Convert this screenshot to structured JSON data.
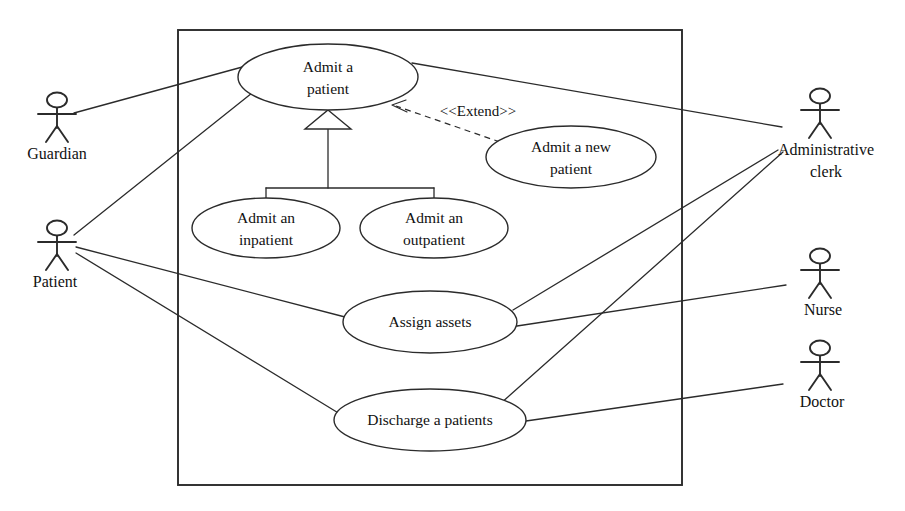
{
  "diagram": {
    "type": "uml-use-case-diagram",
    "system_boundary": {
      "x": 178,
      "y": 30,
      "width": 504,
      "height": 455
    },
    "use_cases": [
      {
        "id": "admit_a_patient",
        "lines": [
          "Admit a",
          "patient"
        ],
        "cx": 328,
        "cy": 77,
        "rx": 90,
        "ry": 33
      },
      {
        "id": "admit_a_new_patient",
        "lines": [
          "Admit a new",
          "patient"
        ],
        "cx": 571,
        "cy": 157,
        "rx": 85,
        "ry": 31
      },
      {
        "id": "admit_an_inpatient",
        "lines": [
          "Admit an",
          "inpatient"
        ],
        "cx": 266,
        "cy": 228,
        "rx": 74,
        "ry": 30
      },
      {
        "id": "admit_an_outpatient",
        "lines": [
          "Admit an",
          "outpatient"
        ],
        "cx": 434,
        "cy": 228,
        "rx": 74,
        "ry": 30
      },
      {
        "id": "assign_assets",
        "lines": [
          "Assign assets"
        ],
        "cx": 430,
        "cy": 322,
        "rx": 87,
        "ry": 31
      },
      {
        "id": "discharge_a_patients",
        "lines": [
          "Discharge a patients"
        ],
        "cx": 430,
        "cy": 420,
        "rx": 96,
        "ry": 31
      }
    ],
    "actors": [
      {
        "id": "guardian",
        "label_lines": [
          "Guardian"
        ],
        "x": 57,
        "y": 100,
        "label_x": 57,
        "label_y": 150
      },
      {
        "id": "patient",
        "label_lines": [
          "Patient"
        ],
        "x": 57,
        "y": 228,
        "label_x": 55,
        "label_y": 278
      },
      {
        "id": "administrative_clerk",
        "label_lines": [
          "Administrative",
          "clerk"
        ],
        "x": 820,
        "y": 96,
        "label_x": 826,
        "label_y": 150
      },
      {
        "id": "nurse",
        "label_lines": [
          "Nurse"
        ],
        "x": 820,
        "y": 256,
        "label_x": 823,
        "label_y": 306
      },
      {
        "id": "doctor",
        "label_lines": [
          "Doctor"
        ],
        "x": 820,
        "y": 348,
        "label_x": 822,
        "label_y": 398
      }
    ],
    "associations": [
      {
        "from": "guardian",
        "to": "admit_a_patient",
        "x1": 74,
        "y1": 113,
        "x2": 246,
        "y2": 66
      },
      {
        "from": "patient",
        "to": "admit_a_patient",
        "x1": 74,
        "y1": 235,
        "x2": 252,
        "y2": 93
      },
      {
        "from": "patient",
        "to": "assign_assets",
        "x1": 76,
        "y1": 247,
        "x2": 345,
        "y2": 317
      },
      {
        "from": "patient",
        "to": "discharge_a_patients",
        "x1": 76,
        "y1": 253,
        "x2": 340,
        "y2": 414
      },
      {
        "from": "administrative_clerk",
        "to": "admit_a_patient",
        "x1": 782,
        "y1": 127,
        "x2": 412,
        "y2": 63
      },
      {
        "from": "administrative_clerk",
        "to": "assign_assets",
        "x1": 778,
        "y1": 150,
        "x2": 513,
        "y2": 310
      },
      {
        "from": "administrative_clerk",
        "to": "discharge_a_patients",
        "x1": 783,
        "y1": 152,
        "x2": 500,
        "y2": 404
      },
      {
        "from": "nurse",
        "to": "assign_assets",
        "x1": 786,
        "y1": 285,
        "x2": 517,
        "y2": 326
      },
      {
        "from": "doctor",
        "to": "discharge_a_patients",
        "x1": 783,
        "y1": 384,
        "x2": 526,
        "y2": 421
      }
    ],
    "generalization": {
      "parent": "admit_a_patient",
      "children": [
        "admit_an_inpatient",
        "admit_an_outpatient"
      ],
      "stem_x": 328,
      "arrow_tip_y": 110,
      "arrow_base_y": 129,
      "arrow_half_width": 23,
      "bus_y": 188,
      "stem_bottom_y": 188,
      "left_x": 266,
      "right_x": 434,
      "child_top_y": 198
    },
    "extend_relation": {
      "label": "<<Extend>>",
      "label_x": 478,
      "label_y": 113,
      "from": "admit_a_new_patient",
      "to": "admit_a_patient",
      "x1": 500,
      "y1": 142,
      "x2": 392,
      "y2": 105
    }
  }
}
